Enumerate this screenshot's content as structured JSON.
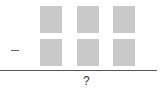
{
  "problem": {
    "operator": "−",
    "rows": [
      {
        "boxes": 3
      },
      {
        "boxes": 3
      }
    ],
    "answer": "?",
    "box_color": "#c9c9c9"
  }
}
